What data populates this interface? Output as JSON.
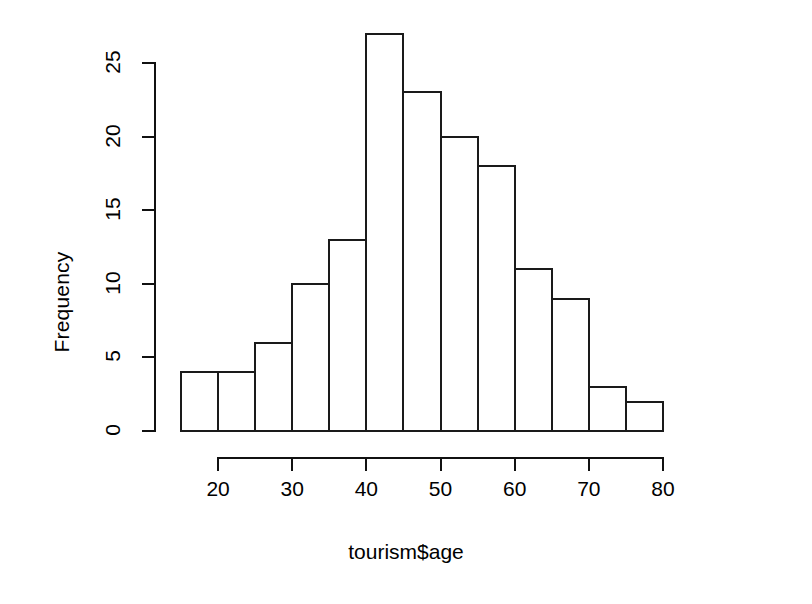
{
  "chart_data": {
    "type": "bar",
    "title": "",
    "subtitle": "",
    "xlabel": "tourism$age",
    "ylabel": "Frequency",
    "grid": false,
    "legend": "none",
    "xlim": [
      15,
      80
    ],
    "ylim": [
      0,
      27
    ],
    "bin_width": 5,
    "x_ticks": [
      20,
      30,
      40,
      50,
      60,
      70,
      80
    ],
    "x_tick_labels": [
      "20",
      "30",
      "40",
      "50",
      "60",
      "70",
      "80"
    ],
    "y_ticks": [
      0,
      5,
      10,
      15,
      20,
      25
    ],
    "y_tick_labels": [
      "0",
      "5",
      "10",
      "15",
      "20",
      "25"
    ],
    "bin_edges": [
      15,
      20,
      25,
      30,
      35,
      40,
      45,
      50,
      55,
      60,
      65,
      70,
      75,
      80
    ],
    "categories": [
      "15-20",
      "20-25",
      "25-30",
      "30-35",
      "35-40",
      "40-45",
      "45-50",
      "50-55",
      "55-60",
      "60-65",
      "65-70",
      "70-75",
      "75-80"
    ],
    "values": [
      4,
      4,
      6,
      10,
      13,
      27,
      23,
      20,
      18,
      11,
      9,
      3,
      2
    ]
  },
  "style": {
    "bar_stroke": "#1a1a1a",
    "bar_fill": "transparent",
    "axis_color": "#111111",
    "background": "#ffffff",
    "text_color": "#000000"
  }
}
